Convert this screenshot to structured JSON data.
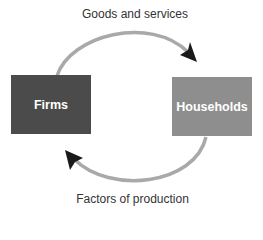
{
  "diagram": {
    "type": "circular-flow",
    "top_label": "Goods and services",
    "bottom_label": "Factors of production",
    "nodes": [
      {
        "id": "firms",
        "label": "Firms",
        "color": "#4b4b4b"
      },
      {
        "id": "households",
        "label": "Households",
        "color": "#8e8e8e"
      }
    ],
    "edges": [
      {
        "from": "Firms",
        "to": "Households",
        "label": "Goods and services"
      },
      {
        "from": "Households",
        "to": "Firms",
        "label": "Factors of production"
      }
    ],
    "colors": {
      "arrow_stroke": "#a9a9a9",
      "arrow_head": "#1a1a1a",
      "text": "#333333"
    }
  }
}
